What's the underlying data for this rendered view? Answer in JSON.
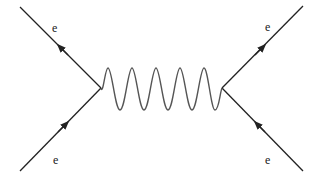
{
  "diagram": {
    "type": "feynman",
    "title": "",
    "colors": {
      "line": "#222222",
      "wave": "#555555",
      "background": "#ffffff"
    },
    "labels": {
      "top_left": "e",
      "bottom_left": "e",
      "top_right": "e",
      "bottom_right": "e"
    },
    "vertices": [
      {
        "name": "left-vertex",
        "x": 101,
        "y": 88
      },
      {
        "name": "right-vertex",
        "x": 222,
        "y": 88
      }
    ],
    "propagator": {
      "kind": "photon",
      "shape": "wavy",
      "peaks": 5
    },
    "external_lines": [
      {
        "name": "incoming-top-left",
        "from": [
          101,
          88
        ],
        "to": [
          20,
          7
        ],
        "arrow": "toward-top-left"
      },
      {
        "name": "incoming-bottom-left",
        "from": [
          20,
          171
        ],
        "to": [
          101,
          88
        ],
        "arrow": "toward-vertex"
      },
      {
        "name": "outgoing-top-right",
        "from": [
          222,
          88
        ],
        "to": [
          303,
          6
        ],
        "arrow": "away-from-vertex"
      },
      {
        "name": "incoming-bottom-right",
        "from": [
          303,
          171
        ],
        "to": [
          222,
          88
        ],
        "arrow": "toward-vertex"
      }
    ]
  }
}
